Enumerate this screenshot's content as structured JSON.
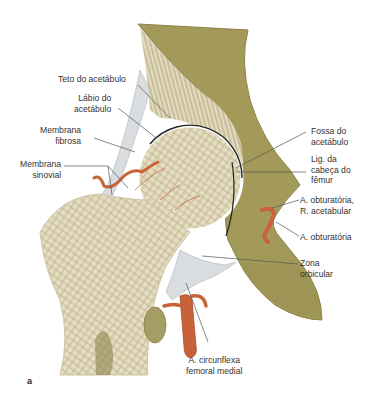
{
  "figure": {
    "panel_letter": "a",
    "colors": {
      "pelvis": "#a39a5a",
      "pelvis_dark": "#8a8143",
      "bone": "#e8e0c6",
      "bone_texture": "#b8ac88",
      "artery": "#c8623a",
      "membrane": "#d9dde0",
      "leader": "#555555",
      "text": "#333333"
    }
  },
  "labels": {
    "teto": {
      "line1": "Teto do acetábulo"
    },
    "labio": {
      "line1": "Lábio do",
      "line2": "acetábulo"
    },
    "membrana_fibrosa": {
      "line1": "Membrana",
      "line2": "fibrosa"
    },
    "membrana_sinovial": {
      "line1": "Membrana",
      "line2": "sinovial"
    },
    "fossa": {
      "line1": "Fossa do",
      "line2": "acetábulo"
    },
    "lig": {
      "line1": "Lig. da",
      "line2": "cabeça do",
      "line3": "fêmur"
    },
    "obt_acet": {
      "line1": "A. obturatória,",
      "line2": "R. acetabular"
    },
    "obt": {
      "line1": "A. obturatória"
    },
    "zona": {
      "line1": "Zona",
      "line2": "orbicular"
    },
    "circunflexa": {
      "line1": "A. circunflexa",
      "line2": "femoral medial"
    }
  }
}
